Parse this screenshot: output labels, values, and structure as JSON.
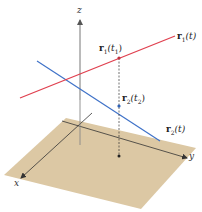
{
  "figure": {
    "type": "3D skew lines diagram",
    "colors": {
      "plane": "#dcc8a4",
      "axis": "#333333",
      "z_axis": "#777777",
      "line1": "#e0404f",
      "line2": "#3f72c8",
      "dashed": "#333333"
    },
    "axes": {
      "x_label": "x",
      "y_label": "y",
      "z_label": "z"
    },
    "curves": [
      {
        "name": "r1",
        "label_bold": "r",
        "label_sub": "1",
        "label_rest": "(t)",
        "color": "#e0404f"
      },
      {
        "name": "r2",
        "label_bold": "r",
        "label_sub": "2",
        "label_rest": "(t)",
        "color": "#3f72c8"
      }
    ],
    "points": [
      {
        "name": "r1(t1)",
        "label_bold": "r",
        "label_sub": "1",
        "label_open": "(t",
        "param_sub": "1",
        "label_close": ")"
      },
      {
        "name": "r2(t2)",
        "label_bold": "r",
        "label_sub": "2",
        "label_open": "(t",
        "param_sub": "2",
        "label_close": ")"
      }
    ]
  }
}
